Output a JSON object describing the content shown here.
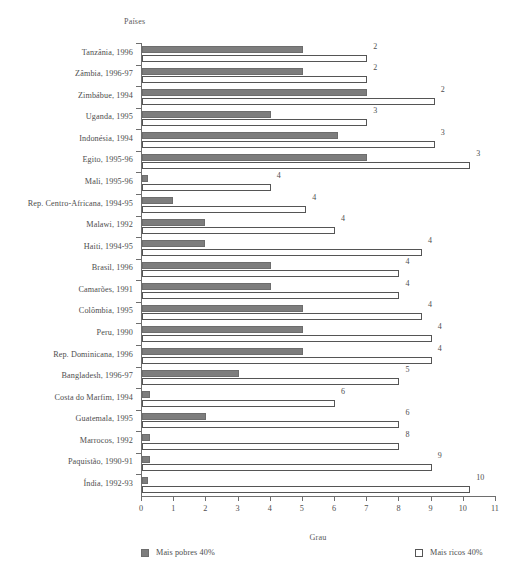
{
  "chart_data": {
    "type": "bar",
    "orientation": "horizontal",
    "title": "",
    "ylabel": "Países",
    "xlabel": "Grau",
    "xlim": [
      0,
      11
    ],
    "xticks": [
      0,
      1,
      2,
      3,
      4,
      5,
      6,
      7,
      8,
      9,
      10,
      11
    ],
    "xtick_labels": [
      "0",
      "1",
      "2",
      "3",
      "4",
      "5",
      "6",
      "7",
      "8",
      "9",
      "10",
      "11"
    ],
    "grid": false,
    "legend_position": "bottom",
    "categories": [
      "Tanzânia, 1996",
      "Zâmbia, 1996-97",
      "Zimbábue, 1994",
      "Uganda, 1995",
      "Indonésia, 1994",
      "Egito, 1995-96",
      "Mali, 1995-96",
      "Rep. Centro-Africana, 1994-95",
      "Malawi, 1992",
      "Haiti, 1994-95",
      "Brasil, 1996",
      "Camarões, 1991",
      "Colômbia, 1995",
      "Peru, 1990",
      "Rep. Dominicana, 1996",
      "Bangladesh, 1996-97",
      "Costa do Marfim, 1994",
      "Guatemala, 1995",
      "Marrocos, 1992",
      "Paquistão, 1990-91",
      "Índia, 1992-93"
    ],
    "series": [
      {
        "name": "Mais pobres 40%",
        "color": "#7d7d7d",
        "values": [
          5.0,
          5.0,
          7.0,
          4.0,
          6.1,
          7.0,
          0.2,
          0.95,
          1.95,
          1.95,
          4.0,
          4.0,
          5.0,
          5.0,
          5.0,
          3.0,
          0.25,
          2.0,
          0.25,
          0.25,
          0.2
        ]
      },
      {
        "name": "Mais ricos 40%",
        "color": "#ffffff",
        "values": [
          7.0,
          7.0,
          9.1,
          7.0,
          9.1,
          10.2,
          4.0,
          5.1,
          6.0,
          8.7,
          8.0,
          8.0,
          8.7,
          9.0,
          9.0,
          8.0,
          6.0,
          8.0,
          8.0,
          9.0,
          10.2
        ]
      }
    ],
    "annotations": [
      "2",
      "2",
      "2",
      "3",
      "3",
      "3",
      "4",
      "4",
      "4",
      "4",
      "4",
      "4",
      "4",
      "4",
      "4",
      "5",
      "6",
      "6",
      "8",
      "9",
      "10"
    ]
  },
  "legend": {
    "entries": [
      {
        "label": "Mais pobres 40%"
      },
      {
        "label": "Mais ricos 40%"
      }
    ]
  }
}
